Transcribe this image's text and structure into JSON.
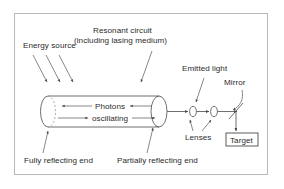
{
  "figure": {
    "background_color": "#ffffff",
    "frame_color": "#b9b9b9",
    "line_color": "#4a4a4a",
    "text_color": "#2b2b2b"
  },
  "labels": {
    "energy_source": "Energy source",
    "resonant_circuit_line1": "Resonant circuit",
    "resonant_circuit_line2": "(including lasing medium)",
    "emitted_light": "Emitted light",
    "mirror": "Mirror",
    "photons": "Photons",
    "oscillating": "oscillating",
    "lenses": "Lenses",
    "target": "Target",
    "fully_reflecting_end": "Fully reflecting end",
    "partially_reflecting_end": "Partially reflecting end"
  },
  "components": [
    {
      "name": "laser-cavity-cylinder",
      "type": "cylinder"
    },
    {
      "name": "fully-reflecting-end",
      "type": "dashed-ellipse"
    },
    {
      "name": "partially-reflecting-end",
      "type": "ellipse"
    },
    {
      "name": "lens-1",
      "type": "ellipse"
    },
    {
      "name": "lens-2",
      "type": "ellipse"
    },
    {
      "name": "mirror",
      "type": "diagonal-line"
    },
    {
      "name": "target",
      "type": "box"
    },
    {
      "name": "beam",
      "type": "line-with-arrow"
    }
  ]
}
